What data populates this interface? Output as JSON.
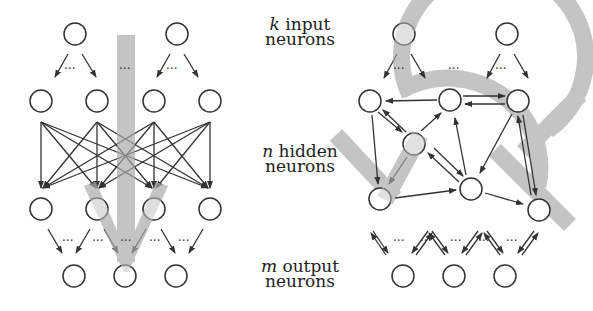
{
  "labels": {
    "input": {
      "var": "k",
      "line1": "input",
      "line2": "neurons"
    },
    "hidden": {
      "var": "n",
      "line1": "hidden",
      "line2": "neurons"
    },
    "output": {
      "var": "m",
      "line1": "output",
      "line2": "neurons"
    }
  },
  "colors": {
    "stroke": "#333333",
    "flow": "#bdbdbd",
    "background": "#ffffff"
  },
  "diagrams": [
    {
      "name": "feedforward-network",
      "flow": "straight downward arrow"
    },
    {
      "name": "recurrent-network",
      "flow": "circular arrows"
    }
  ],
  "ellipsis": "···"
}
